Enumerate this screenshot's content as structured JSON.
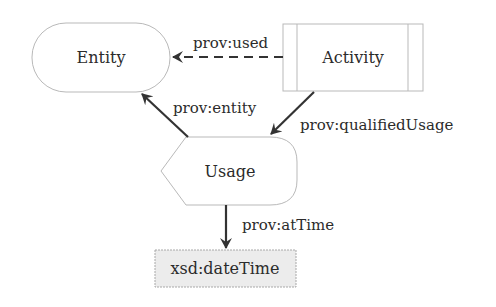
{
  "diagram": {
    "nodes": {
      "entity": {
        "label": "Entity",
        "shape": "rounded-stadium"
      },
      "activity": {
        "label": "Activity",
        "shape": "rectangle-with-side-bars"
      },
      "usage": {
        "label": "Usage",
        "shape": "pointed-left-rounded-right"
      },
      "datetime": {
        "label": "xsd:dateTime",
        "shape": "gray-rectangle"
      }
    },
    "edges": {
      "used": {
        "label": "prov:used",
        "from": "Activity",
        "to": "Entity",
        "style": "dashed"
      },
      "entity": {
        "label": "prov:entity",
        "from": "Usage",
        "to": "Entity",
        "style": "solid"
      },
      "qualified_usage": {
        "label": "prov:qualifiedUsage",
        "from": "Activity",
        "to": "Usage",
        "style": "solid"
      },
      "at_time": {
        "label": "prov:atTime",
        "from": "Usage",
        "to": "xsd:dateTime",
        "style": "solid"
      }
    },
    "colors": {
      "edge": "#333333",
      "node_border": "#b9b9b9",
      "literal_fill": "#ececec",
      "text": "#2b2b2b"
    }
  }
}
